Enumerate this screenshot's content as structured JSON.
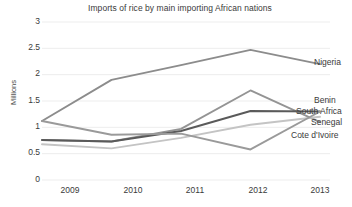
{
  "chart_data": {
    "type": "line",
    "title": "Imports of rice by main importing African nations",
    "xlabel": "",
    "ylabel": "Millions",
    "categories": [
      "2009",
      "2010",
      "2011",
      "2012",
      "2013"
    ],
    "x": [
      2009,
      2010,
      2011,
      2012,
      2013
    ],
    "ylim": [
      0,
      3
    ],
    "yticks": [
      "0",
      "0.5",
      "1",
      "1.5",
      "2",
      "2.5",
      "3"
    ],
    "ytick_values": [
      0,
      0.5,
      1,
      1.5,
      2,
      2.5,
      3
    ],
    "grid": true,
    "legend_position": "right-inline-labels",
    "series": [
      {
        "name": "Nigeria",
        "values": [
          1.12,
          1.9,
          2.18,
          2.47,
          2.2
        ],
        "color": "#8c8c8c"
      },
      {
        "name": "Benin",
        "values": [
          0.76,
          0.73,
          0.97,
          1.7,
          1.1
        ],
        "color": "#949494"
      },
      {
        "name": "South Africa",
        "values": [
          0.76,
          0.73,
          0.93,
          1.31,
          1.3
        ],
        "color": "#5a5a5a"
      },
      {
        "name": "Senegal",
        "values": [
          0.68,
          0.6,
          0.8,
          1.05,
          1.2
        ],
        "color": "#c4c4c4"
      },
      {
        "name": "Cote d'Ivoire",
        "values": [
          1.12,
          0.86,
          0.88,
          0.58,
          1.3
        ],
        "color": "#9a9a9a"
      }
    ]
  },
  "colors": {
    "background": "#ffffff",
    "gridline": "#ededed",
    "text": "#3a3a3a",
    "axis_text": "#3a3a3a"
  },
  "axis": {
    "y_title": "Millions"
  },
  "labels": {
    "nigeria": "Nigeria",
    "benin": "Benin",
    "south_africa": "South Africa",
    "senegal": "Senegal",
    "cote_divoire": "Cote d'Ivoire"
  },
  "yticks": {
    "t0": "3",
    "t1": "2.5",
    "t2": "2",
    "t3": "1.5",
    "t4": "1",
    "t5": "0.5",
    "t6": "0"
  },
  "xticks": {
    "t0": "2009",
    "t1": "2010",
    "t2": "2011",
    "t3": "2012",
    "t4": "2013"
  }
}
